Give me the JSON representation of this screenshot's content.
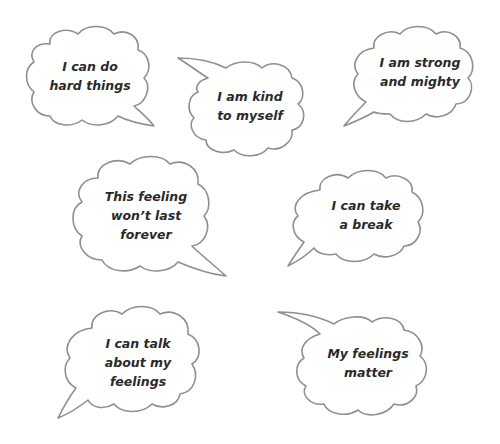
{
  "bubbles": [
    {
      "id": "hard-things",
      "lines": [
        "I can do",
        "hard things"
      ]
    },
    {
      "id": "kind-to-myself",
      "lines": [
        "I am kind",
        "to myself"
      ]
    },
    {
      "id": "strong-mighty",
      "lines": [
        "I am strong",
        "and mighty"
      ]
    },
    {
      "id": "wont-last",
      "lines": [
        "This feeling",
        "won’t last",
        "forever"
      ]
    },
    {
      "id": "take-break",
      "lines": [
        "I can take",
        "a break"
      ]
    },
    {
      "id": "talk-feelings",
      "lines": [
        "I can talk",
        "about my",
        "feelings"
      ]
    },
    {
      "id": "feelings-matter",
      "lines": [
        "My feelings",
        "matter"
      ]
    }
  ],
  "colors": {
    "outline": "#8f8f8f",
    "text": "#2a2a2a",
    "background": "#ffffff"
  }
}
